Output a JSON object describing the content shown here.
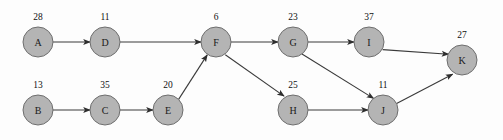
{
  "diagram": {
    "type": "directed-graph",
    "width": 503,
    "height": 140,
    "background_color": "#fdfdfd",
    "node_fill_color": "#b4b4b4",
    "node_stroke_color": "#6e6e6e",
    "edge_color": "#3a3a3a",
    "label_color": "#1a1a1a",
    "node_radius": 15
  },
  "nodes": [
    {
      "id": "A",
      "label": "A",
      "weight": "28",
      "cx": 38,
      "cy": 42,
      "wx": 38,
      "wy": 20
    },
    {
      "id": "D",
      "label": "D",
      "weight": "11",
      "cx": 105,
      "cy": 42,
      "wx": 105,
      "wy": 20
    },
    {
      "id": "F",
      "label": "F",
      "weight": "6",
      "cx": 216,
      "cy": 42,
      "wx": 216,
      "wy": 20
    },
    {
      "id": "G",
      "label": "G",
      "weight": "23",
      "cx": 293,
      "cy": 42,
      "wx": 293,
      "wy": 20
    },
    {
      "id": "I",
      "label": "I",
      "weight": "37",
      "cx": 369,
      "cy": 42,
      "wx": 369,
      "wy": 20
    },
    {
      "id": "K",
      "label": "K",
      "weight": "27",
      "cx": 462,
      "cy": 60,
      "wx": 462,
      "wy": 38
    },
    {
      "id": "B",
      "label": "B",
      "weight": "13",
      "cx": 38,
      "cy": 110,
      "wx": 38,
      "wy": 88
    },
    {
      "id": "C",
      "label": "C",
      "weight": "35",
      "cx": 105,
      "cy": 110,
      "wx": 105,
      "wy": 88
    },
    {
      "id": "E",
      "label": "E",
      "weight": "20",
      "cx": 168,
      "cy": 110,
      "wx": 168,
      "wy": 88
    },
    {
      "id": "H",
      "label": "H",
      "weight": "25",
      "cx": 293,
      "cy": 110,
      "wx": 293,
      "wy": 88
    },
    {
      "id": "J",
      "label": "J",
      "weight": "11",
      "cx": 383,
      "cy": 110,
      "wx": 383,
      "wy": 88
    }
  ],
  "edges": [
    {
      "from": "A",
      "to": "D",
      "x1": 53,
      "y1": 42,
      "x2": 90,
      "y2": 42
    },
    {
      "from": "D",
      "to": "F",
      "x1": 120,
      "y1": 42,
      "x2": 201,
      "y2": 42
    },
    {
      "from": "F",
      "to": "G",
      "x1": 231,
      "y1": 42,
      "x2": 278,
      "y2": 42
    },
    {
      "from": "G",
      "to": "I",
      "x1": 308,
      "y1": 42,
      "x2": 354,
      "y2": 42
    },
    {
      "from": "I",
      "to": "K",
      "x1": 382.6,
      "y1": 49.6,
      "x2": 448.5,
      "y2": 54.2
    },
    {
      "from": "B",
      "to": "C",
      "x1": 53,
      "y1": 110,
      "x2": 90,
      "y2": 110
    },
    {
      "from": "C",
      "to": "E",
      "x1": 120,
      "y1": 110,
      "x2": 153,
      "y2": 110
    },
    {
      "from": "E",
      "to": "F",
      "x1": 178.6,
      "y1": 99.4,
      "x2": 207.2,
      "y2": 54.9
    },
    {
      "from": "F",
      "to": "H",
      "x1": 225.3,
      "y1": 54.8,
      "x2": 284.0,
      "y2": 96.1
    },
    {
      "from": "G",
      "to": "J",
      "x1": 302.0,
      "y1": 54.0,
      "x2": 373.5,
      "y2": 98.4
    },
    {
      "from": "H",
      "to": "J",
      "x1": 308,
      "y1": 110,
      "x2": 368,
      "y2": 110
    },
    {
      "from": "J",
      "to": "K",
      "x1": 396.6,
      "y1": 103.5,
      "x2": 452.6,
      "y2": 74.2
    }
  ]
}
